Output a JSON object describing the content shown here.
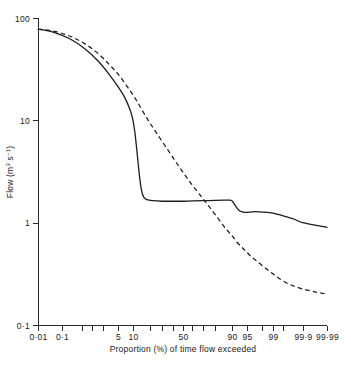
{
  "chart_data": {
    "type": "line",
    "title": "",
    "subtitle": "",
    "xlabel": "Proportion (%) of time flow exceeded",
    "ylabel": "Flow (m³ s⁻¹)",
    "x_scale": "probability",
    "y_scale": "log10",
    "xlim": [
      0.01,
      99.99
    ],
    "ylim": [
      0.1,
      100
    ],
    "grid": false,
    "legend": "none",
    "x_tick_labels": [
      "0·01",
      "0·1",
      "5",
      "10",
      "50",
      "90",
      "95",
      "99",
      "99·9",
      "99·99"
    ],
    "x_tick_values": [
      0.01,
      0.1,
      5,
      10,
      50,
      90,
      95,
      99,
      99.9,
      99.99
    ],
    "x_minor_tick_values": [
      0.5,
      1,
      2,
      20,
      30,
      40,
      60,
      70,
      80,
      98,
      99.5
    ],
    "y_tick_labels": [
      "100",
      "10",
      "1",
      "0·1"
    ],
    "y_tick_values": [
      100,
      10,
      1,
      0.1
    ],
    "series": [
      {
        "name": "solid-curve",
        "style": "solid",
        "color": "#1c1c1c",
        "x": [
          0.01,
          0.05,
          0.2,
          0.6,
          1.5,
          3,
          5,
          7,
          9,
          10,
          11,
          12,
          13,
          14,
          15,
          16,
          18,
          22,
          30,
          40,
          50,
          60,
          70,
          80,
          86,
          89,
          90,
          91,
          92,
          93,
          94,
          95,
          96,
          97,
          98,
          99,
          99.5,
          99.8,
          99.9,
          99.99
        ],
        "y": [
          78,
          72,
          62,
          50,
          38,
          28,
          21,
          16.5,
          12.5,
          10.4,
          7.8,
          5.2,
          3.4,
          2.4,
          1.95,
          1.78,
          1.68,
          1.64,
          1.62,
          1.62,
          1.62,
          1.63,
          1.64,
          1.65,
          1.66,
          1.66,
          1.62,
          1.5,
          1.38,
          1.3,
          1.27,
          1.26,
          1.27,
          1.28,
          1.27,
          1.24,
          1.17,
          1.08,
          1.0,
          0.9
        ]
      },
      {
        "name": "dashed-curve",
        "style": "dashed",
        "color": "#1c1c1c",
        "x": [
          0.01,
          0.05,
          0.2,
          0.6,
          1.5,
          3,
          5,
          8,
          12,
          18,
          25,
          35,
          45,
          55,
          65,
          70,
          75,
          80,
          85,
          88,
          90,
          92,
          94,
          95,
          96,
          97,
          98,
          98.8,
          99.3,
          99.7,
          99.9,
          99.97,
          99.99
        ],
        "y": [
          78,
          74,
          66,
          56,
          45,
          35,
          28,
          21,
          15.5,
          10.5,
          7.6,
          5.2,
          3.7,
          2.7,
          2.0,
          1.72,
          1.45,
          1.2,
          0.95,
          0.82,
          0.74,
          0.64,
          0.56,
          0.52,
          0.47,
          0.43,
          0.38,
          0.33,
          0.29,
          0.25,
          0.225,
          0.21,
          0.2
        ]
      }
    ],
    "annotations": []
  },
  "axes": {
    "y_title": "Flow (m³ s⁻¹)",
    "x_title": "Proportion (%) of time flow exceeded"
  }
}
